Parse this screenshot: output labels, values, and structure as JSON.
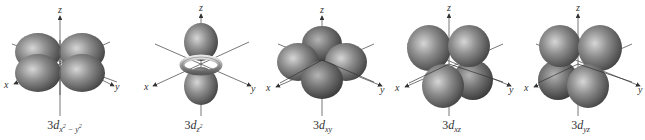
{
  "figure": {
    "colors": {
      "lobe_light": "#c8c8c8",
      "lobe_mid": "#8a8a8a",
      "lobe_dark": "#4a4a4a",
      "axis": "#555555",
      "text": "#333333"
    },
    "axis_labels": {
      "x": "x",
      "y": "y",
      "z": "z"
    },
    "orbitals": [
      {
        "id": "dx2-y2",
        "prefix": "3",
        "d": "d",
        "sub": "x",
        "sup1": "2",
        "mid": " − y",
        "sup2": "2",
        "text": "3dx²−y²"
      },
      {
        "id": "dz2",
        "prefix": "3",
        "d": "d",
        "sub": "z",
        "sup1": "2",
        "mid": "",
        "sup2": "",
        "text": "3dz²"
      },
      {
        "id": "dxy",
        "prefix": "3",
        "d": "d",
        "sub": "xy",
        "sup1": "",
        "mid": "",
        "sup2": "",
        "text": "3dxy"
      },
      {
        "id": "dxz",
        "prefix": "3",
        "d": "d",
        "sub": "xz",
        "sup1": "",
        "mid": "",
        "sup2": "",
        "text": "3dxz"
      },
      {
        "id": "dyz",
        "prefix": "3",
        "d": "d",
        "sub": "yz",
        "sup1": "",
        "mid": "",
        "sup2": "",
        "text": "3dyz"
      }
    ]
  }
}
